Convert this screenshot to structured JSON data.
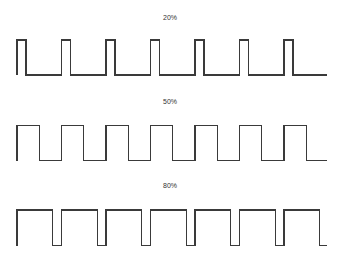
{
  "chart_data": {
    "type": "line",
    "xlabel": "",
    "ylabel": "",
    "grid": false,
    "legend": "none",
    "series": [
      {
        "name": "20%",
        "duty": 0.2,
        "periods": 7,
        "label_y": 19,
        "top": 40,
        "bottom": 75
      },
      {
        "name": "50%",
        "duty": 0.5,
        "periods": 7,
        "label_y": 103,
        "top": 125.5,
        "bottom": 160.5
      },
      {
        "name": "80%",
        "duty": 0.8,
        "periods": 7,
        "label_y": 187,
        "top": 210,
        "bottom": 245.5
      }
    ],
    "x_start": 17,
    "period_px": 44.5,
    "x_end": 327
  },
  "labels": {
    "w20": "20%",
    "w50": "50%",
    "w80": "80%"
  },
  "colors": {
    "stroke": "#3a3a3a",
    "background": "#ffffff"
  }
}
